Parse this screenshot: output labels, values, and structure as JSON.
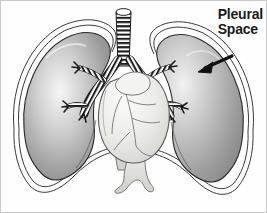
{
  "figure": {
    "background_color": "#fefefe",
    "border_color": "#bdbdbd",
    "width": 267,
    "height": 213
  },
  "annotation": {
    "label": "Pleural\nSpace",
    "label_line_1": "Pleural",
    "label_line_2": "Space",
    "text_color": "#1a1a1a",
    "arrow": {
      "name": "pointer-arrow",
      "points_to": "pleural-space-membrane",
      "direction": "down-left",
      "color": "#111111"
    }
  },
  "structures": [
    {
      "name": "left-lung",
      "label": "Left lung",
      "fill": "#9a9a9a",
      "highlight": "#f2f2f2",
      "outline": "#2b2b2b"
    },
    {
      "name": "right-lung",
      "label": "Right lung",
      "fill": "#a8a8a8",
      "highlight": "#efefef",
      "outline": "#2b2b2b"
    },
    {
      "name": "pleural-space-membrane",
      "label": "Pleural space",
      "fill": "#ffffff",
      "outline": "#333333"
    },
    {
      "name": "trachea",
      "label": "Trachea",
      "fill": "#ffffff",
      "ring_color": "#1c1c1c"
    },
    {
      "name": "left-bronchus",
      "label": "Left main bronchus",
      "fill": "#ffffff",
      "ring_color": "#1c1c1c"
    },
    {
      "name": "right-bronchus",
      "label": "Right main bronchus",
      "fill": "#ffffff",
      "ring_color": "#1c1c1c"
    },
    {
      "name": "heart",
      "label": "Heart",
      "fill": "#ededeb",
      "outline": "#5a5a5a",
      "vessel_color": "#6e6e6e"
    },
    {
      "name": "great-vessels",
      "label": "Great vessels",
      "fill": "#e8e8e6",
      "outline": "#6a6a6a"
    }
  ],
  "colors": {
    "ink": "#1f1f1f",
    "lung_dark": "#8f8f8f",
    "lung_light": "#f4f4f4",
    "paper": "#fefefe"
  }
}
